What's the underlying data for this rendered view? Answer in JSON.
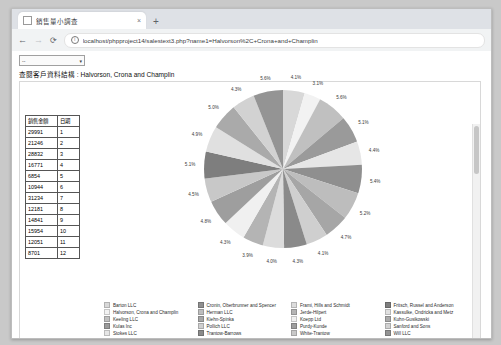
{
  "browser": {
    "tab": {
      "title": "銷售量小調查",
      "favicon_icon": "page-icon",
      "close_icon": "×"
    },
    "newtab_label": "+",
    "back_icon": "←",
    "forward_icon": "→",
    "reload_icon": "⟳",
    "info_icon": "ⓘ",
    "url": "localhost/phpproject14/salestext3.php?name1=Halvorson%2C+Crona+and+Champlin"
  },
  "page": {
    "select_value": "--",
    "select_caret": "▾",
    "title": "查閱客戶資料結構 : Halvorson, Crona and Champlin"
  },
  "table": {
    "headers": [
      "銷售金額",
      "日期"
    ],
    "rows": [
      [
        "29991",
        "1"
      ],
      [
        "21246",
        "2"
      ],
      [
        "28832",
        "3"
      ],
      [
        "16771",
        "4"
      ],
      [
        "6854",
        "5"
      ],
      [
        "10944",
        "6"
      ],
      [
        "31234",
        "7"
      ],
      [
        "12181",
        "8"
      ],
      [
        "14841",
        "9"
      ],
      [
        "15954",
        "10"
      ],
      [
        "12051",
        "11"
      ],
      [
        "8701",
        "12"
      ]
    ]
  },
  "chart_data": {
    "type": "pie",
    "title": "",
    "legend_position": "bottom",
    "labels": [
      "Barton LLC",
      "Halvorson, Crona and Champlin",
      "Keeling LLC",
      "Kulas Inc",
      "Stokes LLC",
      "Cronin, Oberbrunner and Spencer",
      "Herman LLC",
      "Kiehn-Spinka",
      "Pollich LLC",
      "Trantow-Barrows",
      "Frami, Hills and Schmidt",
      "Jerde-Hilpert",
      "Koepp Ltd",
      "Purdy-Kunde",
      "White-Trantow",
      "Fritsch, Russel and Anderson",
      "Kassulke, Ondricka and Metz",
      "Kuhn-Gusikowski",
      "Sanford and Sons",
      "Will LLC"
    ],
    "values": [
      4.1,
      3.1,
      5.6,
      5.1,
      4.4,
      5.4,
      5.2,
      4.7,
      4.1,
      4.3,
      4.0,
      3.9,
      4.3,
      4.8,
      4.5,
      5.1,
      4.9,
      5.0,
      4.3,
      5.6
    ],
    "display_percents": [
      "4.1%",
      "3.1%",
      "5.6%",
      "5.1%",
      "4.4%",
      "5.4%",
      "5.2%",
      "4.7%",
      "4.1%",
      "4.3%",
      "4.0%",
      "3.9%",
      "4.3%",
      "4.8%",
      "4.5%",
      "5.1%",
      "4.9%",
      "5.0%",
      "4.3%",
      "5.6%"
    ],
    "colors": [
      "#d8d8d8",
      "#f2f2f2",
      "#c0c0c0",
      "#9a9a9a",
      "#e6e6e6",
      "#8f8f8f",
      "#bdbdbd",
      "#a6a6a6",
      "#cfcfcf",
      "#8a8a8a",
      "#dcdcdc",
      "#b4b4b4",
      "#f0f0f0",
      "#9e9e9e",
      "#c8c8c8",
      "#7e7e7e",
      "#e0e0e0",
      "#aaaaaa",
      "#d2d2d2",
      "#949494"
    ]
  }
}
